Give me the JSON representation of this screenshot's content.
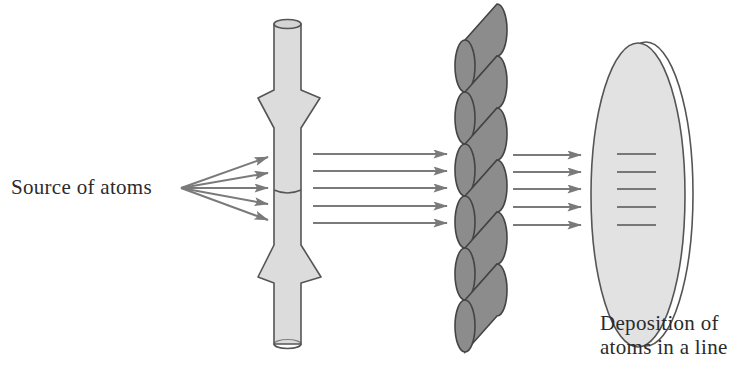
{
  "labels": {
    "source": "Source of atoms",
    "deposition_line1": "Deposition of",
    "deposition_line2": "atoms in a line"
  },
  "components": {
    "source": {
      "name": "atom source",
      "icon": "point-source-fan-arrows",
      "arrow_count": 5
    },
    "collimator": {
      "name": "collimator tube with flared sections",
      "icon": "hourglass-tube"
    },
    "beam": {
      "name": "collimated atomic beam",
      "arrow_count": 5
    },
    "mask": {
      "name": "twisted helical column",
      "icon": "twisted-rope",
      "segment_count": 6
    },
    "beam_after_mask": {
      "arrow_count": 5
    },
    "substrate": {
      "name": "deposition disk",
      "icon": "disk",
      "line_count": 5
    }
  },
  "colors": {
    "background": "#ffffff",
    "stroke": "#555555",
    "arrow": "#7a7a7a",
    "tube_fill": "#dcdcdc",
    "column_fill": "#8c8c8c",
    "disk_fill": "#e2e2e2",
    "text": "#2b2b2b"
  }
}
